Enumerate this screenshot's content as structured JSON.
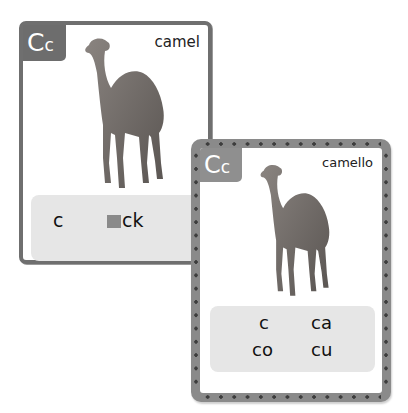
{
  "back_card": {
    "letter_upper": "C",
    "letter_lower": "c",
    "word": "camel",
    "image": "camel-photo",
    "sounds": [
      {
        "text": "c"
      },
      {
        "prefix_blank": true,
        "text": "ck"
      },
      {
        "text": "k"
      }
    ]
  },
  "front_card": {
    "letter_upper": "C",
    "letter_lower": "c",
    "word": "camello",
    "image": "camel-photo",
    "syllables": [
      "c",
      "ca",
      "co",
      "cu"
    ]
  },
  "colors": {
    "back_border": "#6f6f6f",
    "badge_back": "#6d6d6d",
    "badge_front": "#8f8f8f",
    "front_frame": "#8a8a8a",
    "rivet": "#3d3d3d",
    "sound_box": "#e6e6e6"
  }
}
